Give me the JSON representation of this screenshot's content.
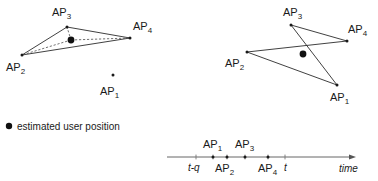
{
  "figure": {
    "legend": {
      "marker": "filled-circle",
      "text": "estimated user position"
    },
    "left_diagram": {
      "name": "triangle-with-diagonals",
      "shape": "triangle",
      "outline_style": "solid",
      "diagonal_style": "dashed",
      "nodes": [
        {
          "id": "ap3",
          "base": "AP",
          "sub": "3",
          "x": 67,
          "y": 27,
          "label_x": 52,
          "label_y": 16,
          "in_shape": true
        },
        {
          "id": "ap4",
          "base": "AP",
          "sub": "4",
          "x": 130,
          "y": 38,
          "label_x": 133,
          "label_y": 30,
          "in_shape": true
        },
        {
          "id": "ap2",
          "base": "AP",
          "sub": "2",
          "x": 22,
          "y": 55,
          "label_x": 6,
          "label_y": 71,
          "in_shape": true
        },
        {
          "id": "ap1",
          "base": "AP",
          "sub": "1",
          "x": 113,
          "y": 75,
          "label_x": 100,
          "label_y": 95,
          "in_shape": false
        }
      ],
      "user_position": {
        "x": 71,
        "y": 40,
        "r": 3.4
      }
    },
    "right_diagram": {
      "name": "quadrilateral",
      "shape": "quadrilateral",
      "outline_style": "solid",
      "nodes": [
        {
          "id": "ap3",
          "base": "AP",
          "sub": "3",
          "x": 291,
          "y": 25,
          "label_x": 283,
          "label_y": 16,
          "in_shape": true
        },
        {
          "id": "ap4",
          "base": "AP",
          "sub": "4",
          "x": 347,
          "y": 41,
          "label_x": 348,
          "label_y": 33,
          "in_shape": true
        },
        {
          "id": "ap2",
          "base": "AP",
          "sub": "2",
          "x": 247,
          "y": 52,
          "label_x": 225,
          "label_y": 67,
          "in_shape": true
        },
        {
          "id": "ap1",
          "base": "AP",
          "sub": "1",
          "x": 337,
          "y": 85,
          "label_x": 330,
          "label_y": 101,
          "in_shape": true
        }
      ],
      "user_position": {
        "x": 303,
        "y": 54,
        "r": 3.4
      }
    },
    "timeline": {
      "name": "time-axis",
      "axis_label": "time",
      "axis_label_x": 339,
      "axis_label_y": 172,
      "line": {
        "x1": 167,
        "x2": 352,
        "y": 157
      },
      "arrow": "right",
      "ticks": [
        {
          "id": "t-minus-q",
          "label": "t-q",
          "x": 196,
          "label_x": 188,
          "label_y": 171,
          "position": "below",
          "style": "italic",
          "has_dot": false
        },
        {
          "id": "ap1",
          "base": "AP",
          "sub": "1",
          "x": 213,
          "label_x": 203,
          "label_y": 148,
          "position": "above",
          "style": "ap",
          "has_dot": true
        },
        {
          "id": "ap2",
          "base": "AP",
          "sub": "2",
          "x": 227,
          "label_x": 215,
          "label_y": 172,
          "position": "below",
          "style": "ap",
          "has_dot": true
        },
        {
          "id": "ap3",
          "base": "AP",
          "sub": "3",
          "x": 245,
          "label_x": 235,
          "label_y": 148,
          "position": "above",
          "style": "ap",
          "has_dot": true
        },
        {
          "id": "ap4",
          "base": "AP",
          "sub": "4",
          "x": 268,
          "label_x": 258,
          "label_y": 172,
          "position": "below",
          "style": "ap",
          "has_dot": true
        },
        {
          "id": "t",
          "label": "t",
          "x": 285,
          "label_x": 284,
          "label_y": 171,
          "position": "below",
          "style": "italic",
          "has_dot": false
        }
      ]
    },
    "colors": {
      "edge": "#2b2b2b",
      "diagonal": "#4d4d4d",
      "dot": "#111111",
      "axis": "#555555",
      "text": "#1a1a1a",
      "background": "#ffffff"
    }
  }
}
